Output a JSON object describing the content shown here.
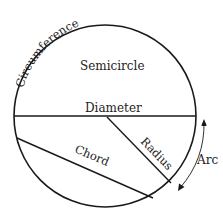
{
  "diagram": {
    "labels": {
      "circumference": "Circumference",
      "semicircle": "Semicircle",
      "diameter": "Diameter",
      "radius": "Radius",
      "chord": "Chord",
      "arc": "Arc"
    },
    "colors": {
      "stroke": "#1a1a1a",
      "text": "#222222",
      "background": "#ffffff"
    }
  }
}
